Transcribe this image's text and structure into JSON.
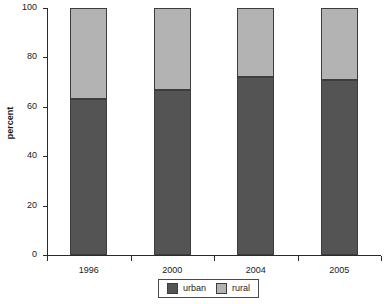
{
  "chart_data": {
    "type": "bar",
    "stacked": true,
    "title": "",
    "xlabel": "",
    "ylabel": "percent",
    "categories": [
      "1996",
      "2000",
      "2004",
      "2005"
    ],
    "series": [
      {
        "name": "urban",
        "color": "#545454",
        "values": [
          63,
          67,
          72,
          71
        ]
      },
      {
        "name": "rural",
        "color": "#b3b3b3",
        "values": [
          37,
          33,
          28,
          29
        ]
      }
    ],
    "ylim": [
      0,
      100
    ],
    "yticks": [
      0,
      20,
      40,
      60,
      80,
      100
    ],
    "ytick_labels": [
      "0",
      "20",
      "40",
      "60",
      "80",
      "100"
    ],
    "grid": false,
    "legend_position": "bottom",
    "legend": [
      "urban",
      "rural"
    ]
  },
  "colors": {
    "urban": "#545454",
    "rural": "#b3b3b3",
    "axis": "#2b2b2b",
    "bar_edge": "#3d3d3d",
    "background": "#ffffff"
  }
}
